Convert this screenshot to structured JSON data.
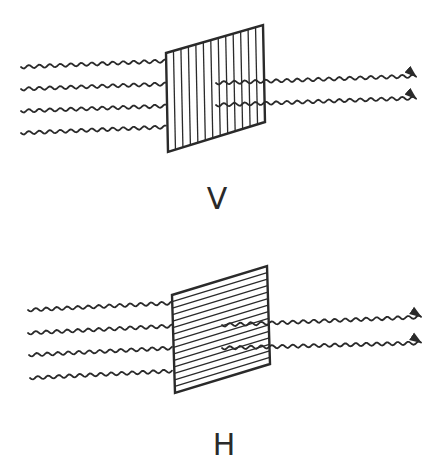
{
  "diagram": {
    "stroke_color": "#2a2a2a",
    "background": "#ffffff",
    "panels": [
      {
        "id": "vertical",
        "label": "V",
        "label_pos": [
          217,
          184
        ],
        "polarizer": {
          "corners": [
            [
              166,
              53
            ],
            [
              263,
              25
            ],
            [
              265,
              122
            ],
            [
              168,
              152
            ]
          ],
          "line_orientation": "vertical",
          "line_count": 12
        },
        "incoming_waves": [
          {
            "start": [
              21,
              67
            ],
            "end": [
              166,
              61
            ]
          },
          {
            "start": [
              21,
              89
            ],
            "end": [
              166,
              84
            ]
          },
          {
            "start": [
              21,
              111
            ],
            "end": [
              166,
              106
            ]
          },
          {
            "start": [
              21,
              133
            ],
            "end": [
              166,
              127
            ]
          }
        ],
        "outgoing_waves": [
          {
            "start": [
              216,
              83
            ],
            "end": [
              416,
              76
            ]
          },
          {
            "start": [
              216,
              105
            ],
            "end": [
              416,
              98
            ]
          }
        ]
      },
      {
        "id": "horizontal",
        "label": "H",
        "label_pos": [
          224,
          430
        ],
        "polarizer": {
          "corners": [
            [
              172,
              295
            ],
            [
              267,
              266
            ],
            [
              270,
              364
            ],
            [
              175,
              393
            ]
          ],
          "line_orientation": "horizontal",
          "line_count": 14
        },
        "incoming_waves": [
          {
            "start": [
              28,
              310
            ],
            "end": [
              172,
              303
            ]
          },
          {
            "start": [
              28,
              333
            ],
            "end": [
              172,
              326
            ]
          },
          {
            "start": [
              29,
              355
            ],
            "end": [
              172,
              348
            ]
          },
          {
            "start": [
              30,
              378
            ],
            "end": [
              172,
              371
            ]
          }
        ],
        "outgoing_waves": [
          {
            "start": [
              222,
              325
            ],
            "end": [
              421,
              317
            ]
          },
          {
            "start": [
              222,
              348
            ],
            "end": [
              421,
              343
            ]
          }
        ]
      }
    ]
  }
}
